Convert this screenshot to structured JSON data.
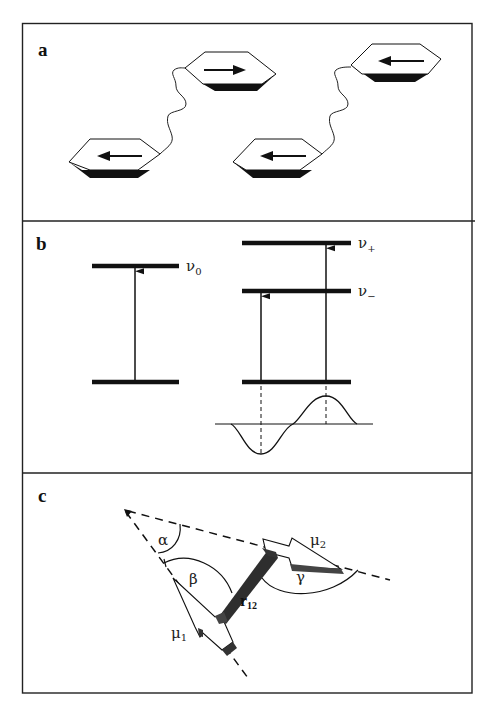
{
  "figure": {
    "panels": [
      {
        "label": "a",
        "description": "Two bichromophoric molecules: aromatic rings with transition-dipole arrows joined by flexible linkers",
        "chromophores": [
          {
            "id": "A",
            "arrow": "left"
          },
          {
            "id": "B",
            "arrow": "right"
          },
          {
            "id": "C",
            "arrow": "left"
          },
          {
            "id": "D",
            "arrow": "left"
          }
        ]
      },
      {
        "label": "b",
        "description": "Energy level diagram: monomer transition vs exciton-split transitions with CD couplet",
        "levels": {
          "monomer": "ν",
          "monomer_sub": "0",
          "upper_exciton": "ν",
          "upper_exciton_sub": "+",
          "lower_exciton": "ν",
          "lower_exciton_sub": "−"
        }
      },
      {
        "label": "c",
        "description": "Geometry of two coupled dipoles",
        "symbols": {
          "alpha": "α",
          "beta": "β",
          "gamma": "γ",
          "mu1": "μ",
          "mu1_sub": "1",
          "mu2": "μ",
          "mu2_sub": "2",
          "r": "r",
          "r_sub": "12"
        }
      }
    ],
    "colors": {
      "ink": "#111111",
      "shade": "#3a3a3a",
      "background": "#ffffff"
    }
  }
}
